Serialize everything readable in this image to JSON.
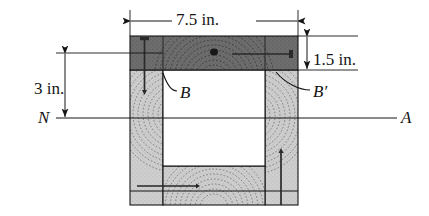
{
  "figure": {
    "dimensions": {
      "width": "7.5 in.",
      "top_flange_thickness": "1.5 in.",
      "depth_to_neutral_axis": "3 in."
    },
    "labels": {
      "point_b": "B",
      "point_b_prime": "B′",
      "axis_left": "N",
      "axis_right": "A"
    },
    "colors": {
      "line": "#141414",
      "top_flange_fill": "#6f6f6f",
      "web_fill": "#c9c9c9",
      "cavity_fill": "#ffffff",
      "grain": "#3a3a3a",
      "knot": "#1c1c1c"
    },
    "geometry": {
      "section_left": 130,
      "section_right": 298,
      "section_top": 36,
      "section_bottom": 205,
      "top_flange_bottom": 70,
      "neutral_axis_y": 118,
      "cavity_left": 163,
      "cavity_right": 265,
      "cavity_bottom": 166
    }
  }
}
